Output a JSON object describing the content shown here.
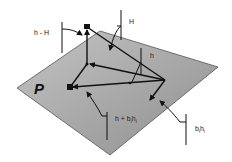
{
  "diagram": {
    "plane_label": "P",
    "labels": {
      "h_minus_H": "h - H",
      "H": "H",
      "h": "h",
      "h_plus_bh": "h + b",
      "h_plus_bh_sub": "i",
      "h_plus_bh_h": "h",
      "h_plus_bh_sub2": "i",
      "bh_b": "b",
      "bh_sub": "i",
      "bh_h": "h",
      "bh_sub2": "i"
    },
    "colors": {
      "plane_fill": "#a8a8a8",
      "plane_edge": "#555555",
      "line": "#111111",
      "background": "#ffffff"
    }
  }
}
